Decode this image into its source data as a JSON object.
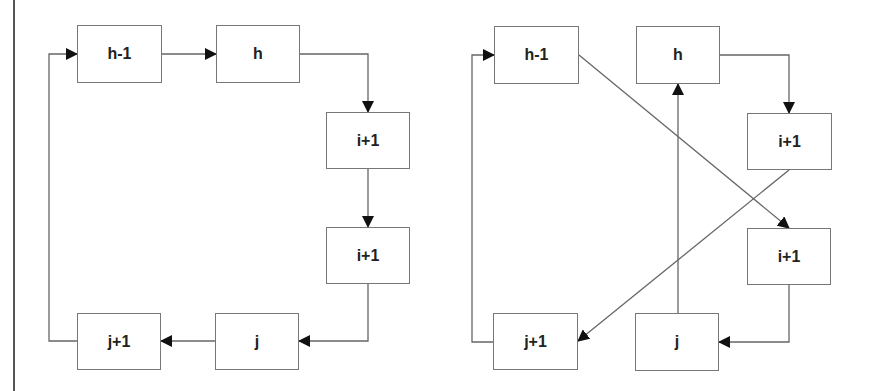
{
  "diagrams": [
    {
      "name": "sequential-order",
      "nodes": [
        {
          "id": "h-1",
          "label": "h-1",
          "x": 77,
          "y": 25,
          "w": 85,
          "h": 58
        },
        {
          "id": "h",
          "label": "h",
          "x": 216,
          "y": 25,
          "w": 84,
          "h": 58
        },
        {
          "id": "i+1a",
          "label": "i+1",
          "x": 326,
          "y": 112,
          "w": 84,
          "h": 57
        },
        {
          "id": "i+1b",
          "label": "i+1",
          "x": 326,
          "y": 227,
          "w": 84,
          "h": 57
        },
        {
          "id": "j",
          "label": "j",
          "x": 215,
          "y": 313,
          "w": 84,
          "h": 57
        },
        {
          "id": "j+1",
          "label": "j+1",
          "x": 77,
          "y": 313,
          "w": 84,
          "h": 57
        }
      ],
      "edges": [
        {
          "from": "h-1",
          "to": "h",
          "points": [
            [
              162,
              54
            ],
            [
              216,
              54
            ]
          ]
        },
        {
          "from": "h",
          "to": "i+1a",
          "points": [
            [
              300,
              54
            ],
            [
              368,
              54
            ],
            [
              368,
              112
            ]
          ]
        },
        {
          "from": "i+1a",
          "to": "i+1b",
          "points": [
            [
              368,
              169
            ],
            [
              368,
              227
            ]
          ]
        },
        {
          "from": "i+1b",
          "to": "j",
          "points": [
            [
              368,
              284
            ],
            [
              368,
              341
            ],
            [
              299,
              341
            ]
          ]
        },
        {
          "from": "j",
          "to": "j+1",
          "points": [
            [
              215,
              341
            ],
            [
              161,
              341
            ]
          ]
        },
        {
          "from": "j+1",
          "to": "h-1",
          "points": [
            [
              77,
              341
            ],
            [
              49,
              341
            ],
            [
              49,
              54
            ],
            [
              77,
              54
            ]
          ]
        }
      ]
    },
    {
      "name": "reordered",
      "nodes": [
        {
          "id": "h-1",
          "label": "h-1",
          "x": 494,
          "y": 26,
          "w": 85,
          "h": 58
        },
        {
          "id": "h",
          "label": "h",
          "x": 636,
          "y": 26,
          "w": 84,
          "h": 58
        },
        {
          "id": "i+1a",
          "label": "i+1",
          "x": 747,
          "y": 113,
          "w": 85,
          "h": 57
        },
        {
          "id": "i+1b",
          "label": "i+1",
          "x": 747,
          "y": 228,
          "w": 84,
          "h": 57
        },
        {
          "id": "j+1",
          "label": "j+1",
          "x": 493,
          "y": 313,
          "w": 85,
          "h": 57
        },
        {
          "id": "j",
          "label": "j",
          "x": 635,
          "y": 313,
          "w": 84,
          "h": 58
        }
      ],
      "edges": [
        {
          "from": "h",
          "to": "i+1a",
          "points": [
            [
              720,
              55
            ],
            [
              789,
              55
            ],
            [
              789,
              113
            ]
          ]
        },
        {
          "from": "h-1",
          "to": "i+1b",
          "points": [
            [
              579,
              55
            ],
            [
              789,
              228
            ]
          ]
        },
        {
          "from": "i+1a",
          "to": "j+1",
          "points": [
            [
              789,
              170
            ],
            [
              578,
              341
            ]
          ]
        },
        {
          "from": "i+1b",
          "to": "j",
          "points": [
            [
              789,
              285
            ],
            [
              789,
              342
            ],
            [
              719,
              342
            ]
          ]
        },
        {
          "from": "j",
          "to": "h",
          "points": [
            [
              678,
              313
            ],
            [
              678,
              84
            ]
          ]
        },
        {
          "from": "j+1",
          "to": "h-1",
          "points": [
            [
              493,
              342
            ],
            [
              472,
              342
            ],
            [
              472,
              55
            ],
            [
              494,
              55
            ]
          ]
        }
      ]
    }
  ]
}
